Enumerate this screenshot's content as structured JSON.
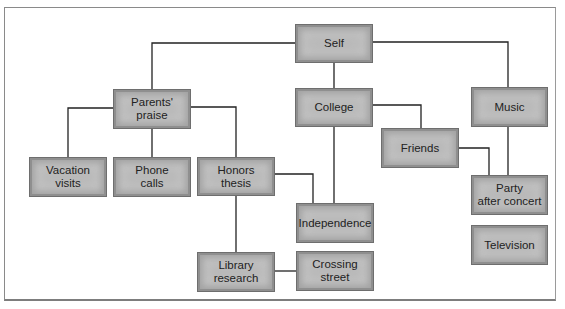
{
  "diagram": {
    "type": "concept-map",
    "nodes": [
      {
        "id": "self",
        "label": "Self"
      },
      {
        "id": "parents_praise",
        "label": "Parents'\npraise"
      },
      {
        "id": "college",
        "label": "College"
      },
      {
        "id": "music",
        "label": "Music"
      },
      {
        "id": "vacation_visits",
        "label": "Vacation\nvisits"
      },
      {
        "id": "phone_calls",
        "label": "Phone\ncalls"
      },
      {
        "id": "honors_thesis",
        "label": "Honors\nthesis"
      },
      {
        "id": "friends",
        "label": "Friends"
      },
      {
        "id": "party_after_concert",
        "label": "Party\nafter concert"
      },
      {
        "id": "independence",
        "label": "Independence"
      },
      {
        "id": "television",
        "label": "Television"
      },
      {
        "id": "library_research",
        "label": "Library\nresearch"
      },
      {
        "id": "crossing_street",
        "label": "Crossing\nstreet"
      }
    ],
    "edges": [
      {
        "from": "self",
        "to": "parents_praise"
      },
      {
        "from": "self",
        "to": "college"
      },
      {
        "from": "self",
        "to": "music"
      },
      {
        "from": "parents_praise",
        "to": "vacation_visits"
      },
      {
        "from": "parents_praise",
        "to": "phone_calls"
      },
      {
        "from": "parents_praise",
        "to": "honors_thesis"
      },
      {
        "from": "college",
        "to": "friends"
      },
      {
        "from": "college",
        "to": "independence"
      },
      {
        "from": "friends",
        "to": "party_after_concert"
      },
      {
        "from": "music",
        "to": "party_after_concert"
      },
      {
        "from": "honors_thesis",
        "to": "independence"
      },
      {
        "from": "honors_thesis",
        "to": "library_research"
      },
      {
        "from": "library_research",
        "to": "crossing_street"
      }
    ],
    "colors": {
      "node_fill": "#b9b9b9",
      "node_border": "#6e6e6e",
      "line": "#222222",
      "text": "#222222"
    }
  }
}
